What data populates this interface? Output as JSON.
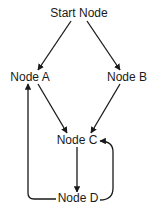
{
  "diagram": {
    "type": "directed-graph",
    "nodes": [
      {
        "id": "start",
        "label": "Start Node",
        "x": 79,
        "y": 13
      },
      {
        "id": "a",
        "label": "Node A",
        "x": 30,
        "y": 77
      },
      {
        "id": "b",
        "label": "Node B",
        "x": 127,
        "y": 77
      },
      {
        "id": "c",
        "label": "Node C",
        "x": 77,
        "y": 140
      },
      {
        "id": "d",
        "label": "Node D",
        "x": 78,
        "y": 198
      }
    ],
    "edges": [
      {
        "from": "Start Node",
        "to": "Node A"
      },
      {
        "from": "Start Node",
        "to": "Node B"
      },
      {
        "from": "Node A",
        "to": "Node C"
      },
      {
        "from": "Node B",
        "to": "Node C"
      },
      {
        "from": "Node C",
        "to": "Node D"
      },
      {
        "from": "Node D",
        "to": "Node A"
      },
      {
        "from": "Node D",
        "to": "Node C"
      }
    ],
    "colors": {
      "line": "#1a1a1a",
      "background": "#ffffff",
      "text": "#1a1a1a"
    }
  }
}
